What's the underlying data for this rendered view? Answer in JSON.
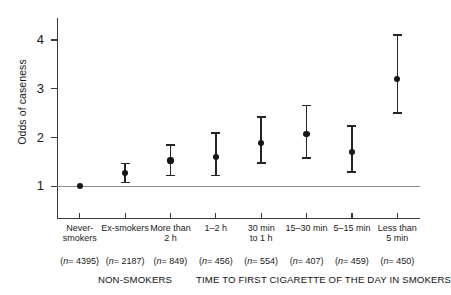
{
  "chart_data": {
    "type": "scatter",
    "title": "",
    "subtitle": "",
    "xlabel": "",
    "ylabel": "Odds of caseness",
    "ylim": [
      0.35,
      4.45
    ],
    "yticks": [
      1,
      2,
      3,
      4
    ],
    "ytick_labels": [
      "1",
      "2",
      "3",
      "4"
    ],
    "grid": false,
    "legend": "none",
    "reference_line": {
      "y": 1,
      "label": "1"
    },
    "error_bars": "95% confidence interval",
    "categories": [
      "Never-smokers",
      "Ex-smokers",
      "More than\n2 h",
      "1–2 h",
      "30 min\nto 1 h",
      "15–30 min",
      "5–15 min",
      "Less than\n5 min"
    ],
    "values": [
      1.0,
      1.28,
      1.53,
      1.6,
      1.89,
      2.08,
      1.71,
      3.2
    ],
    "ci_lower": [
      1.0,
      1.08,
      1.22,
      1.22,
      1.48,
      1.58,
      1.29,
      2.5
    ],
    "ci_upper": [
      1.0,
      1.47,
      1.85,
      2.09,
      2.42,
      2.66,
      2.23,
      4.1
    ],
    "has_ci": [
      false,
      true,
      true,
      true,
      true,
      true,
      true,
      true
    ],
    "n": [
      4395,
      2187,
      849,
      456,
      554,
      407,
      459,
      450
    ],
    "n_labels": [
      "(n= 4395)",
      "(n= 2187)",
      "(n= 849)",
      "(n= 456)",
      "(n= 554)",
      "(n= 407)",
      "(n= 459)",
      "(n= 450)"
    ],
    "groups": [
      {
        "label": "NON-SMOKERS",
        "categories": [
          0,
          1
        ]
      },
      {
        "label": "TIME TO FIRST CIGARETTE OF THE DAY IN SMOKERS",
        "categories": [
          2,
          3,
          4,
          5,
          6,
          7
        ]
      }
    ],
    "colors": {
      "marker": "#151515",
      "error_bar": "#252525",
      "axis": "#3a3a3a",
      "reference_line": "#8e8e8e",
      "text": "#1a1a1a",
      "background": "#ffffff"
    }
  }
}
